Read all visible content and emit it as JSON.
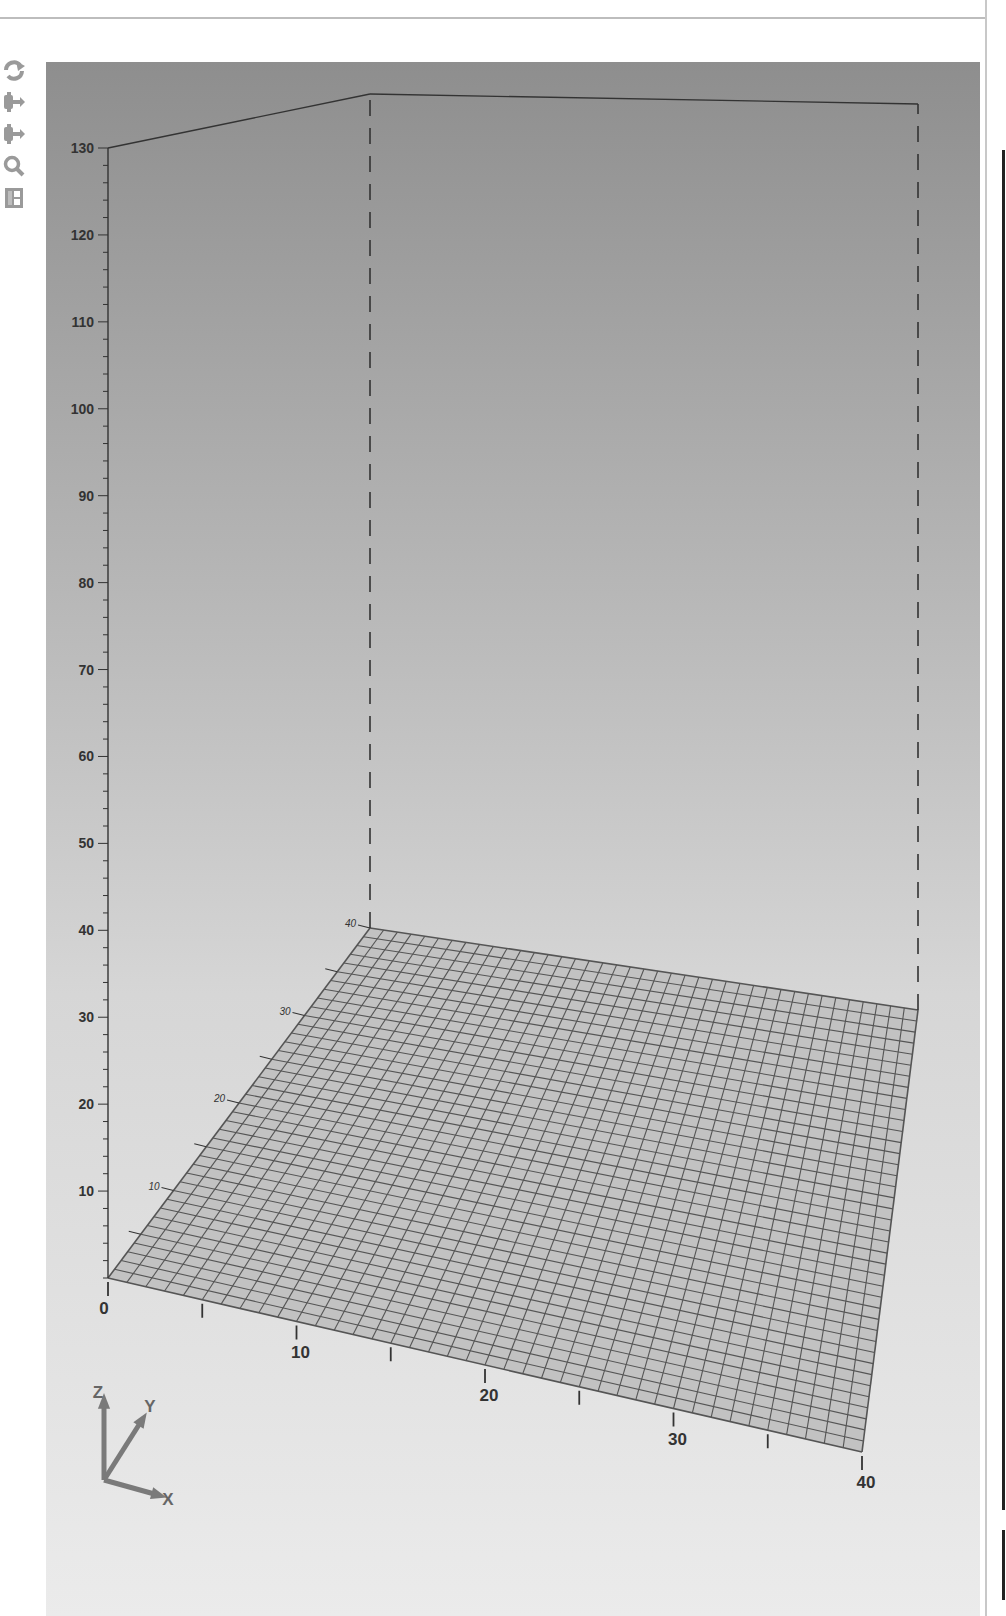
{
  "toolbar": {
    "items": [
      {
        "name": "rotate-icon",
        "label": "Rotate"
      },
      {
        "name": "pan-icon",
        "label": "Pan"
      },
      {
        "name": "pan-alt-icon",
        "label": "Move"
      },
      {
        "name": "zoom-icon",
        "label": "Zoom"
      },
      {
        "name": "layout-icon",
        "label": "Layout"
      }
    ]
  },
  "colors": {
    "background_top": "#8e8e8e",
    "background_bottom": "#e6e6e6",
    "floor_fill": "#c2c2c2",
    "grid_line": "#555555",
    "axis_line": "#333333"
  },
  "chart_data": {
    "type": "surface3d",
    "title": "",
    "xlabel": "X",
    "ylabel": "Y",
    "zlabel": "Z",
    "x_range": [
      0,
      40
    ],
    "y_range": [
      0,
      40
    ],
    "z_range": [
      0,
      130
    ],
    "x_ticks": [
      0,
      10,
      20,
      30,
      40
    ],
    "x_minor_ticks": [
      5,
      15,
      25,
      35
    ],
    "y_ticks": [
      10,
      20,
      30,
      40
    ],
    "y_minor_ticks": [
      5,
      15,
      25,
      35
    ],
    "z_ticks": [
      10,
      20,
      30,
      40,
      50,
      60,
      70,
      80,
      90,
      100,
      110,
      120,
      130
    ],
    "grid_divisions": 40,
    "surface": "flat plane at z = 0 over 40 x 40 grid",
    "bounding_box": "dashed vertical edges with solid top edges at z = 130",
    "orientation_triad": [
      "Z",
      "Y",
      "X"
    ]
  }
}
